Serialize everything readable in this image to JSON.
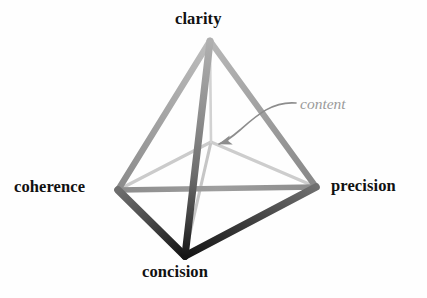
{
  "figure": {
    "type": "tetrahedron-diagram",
    "title": "",
    "background_color": "#fefefe"
  },
  "vertices": [
    {
      "id": "clarity",
      "label": "clarity",
      "position": "apex-top",
      "x": 210,
      "y": 40,
      "label_color": "#111111",
      "label_style": "bold"
    },
    {
      "id": "coherence",
      "label": "coherence",
      "position": "left",
      "x": 118,
      "y": 190,
      "label_color": "#111111",
      "label_style": "bold"
    },
    {
      "id": "precision",
      "label": "precision",
      "position": "right",
      "x": 316,
      "y": 187,
      "label_color": "#111111",
      "label_style": "bold"
    },
    {
      "id": "concision",
      "label": "concision",
      "position": "bottom",
      "x": 185,
      "y": 255,
      "label_color": "#111111",
      "label_style": "bold"
    },
    {
      "id": "content",
      "label": "content",
      "position": "interior-center",
      "x": 211,
      "y": 142,
      "label_color": "#9a9a9a",
      "label_style": "italic"
    }
  ],
  "edges": [
    {
      "from": "clarity",
      "to": "coherence",
      "shade": "medium-gray",
      "color": "#9b9b9b"
    },
    {
      "from": "clarity",
      "to": "precision",
      "shade": "medium-gray",
      "color": "#9b9b9b"
    },
    {
      "from": "clarity",
      "to": "concision",
      "shade": "dark-gradient",
      "color": "#6a6a6a"
    },
    {
      "from": "coherence",
      "to": "precision",
      "shade": "medium-gray",
      "color": "#8f8f8f"
    },
    {
      "from": "coherence",
      "to": "concision",
      "shade": "near-black",
      "color": "#2a2a2a"
    },
    {
      "from": "precision",
      "to": "concision",
      "shade": "near-black",
      "color": "#2a2a2a"
    },
    {
      "from": "content",
      "to": "coherence",
      "shade": "light-gray",
      "color": "#c9c9c9"
    },
    {
      "from": "content",
      "to": "precision",
      "shade": "light-gray",
      "color": "#c9c9c9"
    },
    {
      "from": "content",
      "to": "concision",
      "shade": "light-gray",
      "color": "#c9c9c9"
    },
    {
      "from": "content",
      "to": "clarity",
      "shade": "light-gray",
      "color": "#c9c9c9"
    }
  ],
  "annotation": {
    "label": "content",
    "color": "#9a9a9a",
    "arrow": "curved-leader-arrow",
    "arrow_from_x": 296,
    "arrow_from_y": 103,
    "arrow_to_x": 216,
    "arrow_to_y": 145
  },
  "colors": {
    "label_text": "#111111",
    "annotation_text": "#9a9a9a",
    "edge_light": "#c9c9c9",
    "edge_medium": "#9b9b9b",
    "edge_dark": "#2a2a2a",
    "background": "#fefefe"
  }
}
